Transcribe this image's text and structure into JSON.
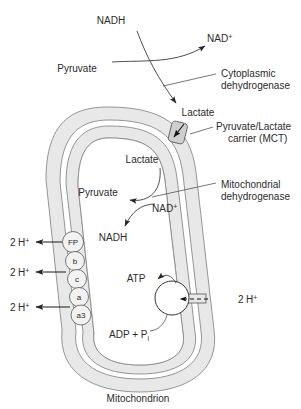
{
  "figure": {
    "caption": "Mitochondrion",
    "background_color": "#ffffff",
    "membrane_fill": "#e8e8e8",
    "text_color": "#2b2b2b"
  },
  "cytoplasm": {
    "nadh": "NADH",
    "nad_plus": "NAD",
    "nad_plus_sup": "+",
    "pyruvate": "Pyruvate",
    "lactate": "Lactate",
    "enzyme_line1": "Cytoplasmic",
    "enzyme_line2": "dehydrogenase"
  },
  "carrier": {
    "line1": "Pyruvate/Lactate",
    "line2": "carrier (MCT)",
    "icon": "transporter-icon"
  },
  "matrix": {
    "lactate": "Lactate",
    "pyruvate": "Pyruvate",
    "nad_plus": "NAD",
    "nad_plus_sup": "+",
    "nadh": "NADH",
    "enzyme_line1": "Mitochondrial",
    "enzyme_line2": "dehydrogenase"
  },
  "etc": {
    "complexes": [
      {
        "label": "FP",
        "name": "flavoprotein"
      },
      {
        "label": "b",
        "name": "cytochrome-b"
      },
      {
        "label": "c",
        "name": "cytochrome-c"
      },
      {
        "label": "a",
        "name": "cytochrome-a"
      },
      {
        "label": "a3",
        "name": "cytochrome-a3"
      }
    ],
    "proton_pumps": [
      {
        "count": "2",
        "species": "H",
        "charge": "+"
      },
      {
        "count": "2",
        "species": "H",
        "charge": "+"
      },
      {
        "count": "2",
        "species": "H",
        "charge": "+"
      }
    ]
  },
  "atp_synthase": {
    "product": "ATP",
    "substrate": "ADP + P",
    "substrate_sub": "i",
    "proton_count": "2",
    "proton_species": "H",
    "proton_charge": "+"
  }
}
